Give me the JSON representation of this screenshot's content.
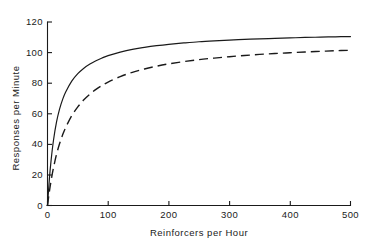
{
  "chart_data": {
    "type": "line",
    "title": "",
    "xlabel": "Reinforcers per Hour",
    "ylabel": "Responses per Minute",
    "xlim": [
      0,
      500
    ],
    "ylim": [
      0,
      120
    ],
    "xticks": [
      0,
      100,
      200,
      300,
      400,
      500
    ],
    "yticks": [
      0,
      20,
      40,
      60,
      80,
      100,
      120
    ],
    "xtick_labels": [
      "0",
      "100",
      "200",
      "300",
      "400",
      "500"
    ],
    "ytick_labels": [
      "0",
      "20",
      "40",
      "60",
      "80",
      "100",
      "120"
    ],
    "grid": false,
    "legend": "none",
    "series": [
      {
        "name": "solid-curve",
        "style": "solid",
        "color": "#1a1a1a",
        "x": [
          0,
          3,
          6,
          10,
          15,
          20,
          25,
          30,
          40,
          50,
          60,
          70,
          80,
          90,
          100,
          120,
          140,
          160,
          180,
          200,
          225,
          250,
          275,
          300,
          325,
          350,
          375,
          400,
          425,
          450,
          475,
          500
        ],
        "y": [
          0,
          16.9,
          29.8,
          43.0,
          54.8,
          63.2,
          69.4,
          74.2,
          81.3,
          86.2,
          89.8,
          92.5,
          94.7,
          96.5,
          98.0,
          100.3,
          102.1,
          103.4,
          104.5,
          105.4,
          106.3,
          107.1,
          107.7,
          108.2,
          108.6,
          109.0,
          109.3,
          109.6,
          109.9,
          110.1,
          110.3,
          110.5
        ]
      },
      {
        "name": "dashed-curve",
        "style": "dashed",
        "color": "#1a1a1a",
        "x": [
          0,
          3,
          6,
          10,
          15,
          20,
          25,
          30,
          40,
          50,
          60,
          70,
          80,
          90,
          100,
          120,
          140,
          160,
          180,
          200,
          225,
          250,
          275,
          300,
          325,
          350,
          375,
          400,
          425,
          450,
          475,
          500
        ],
        "y": [
          0,
          8.9,
          16.4,
          24.9,
          33.6,
          40.5,
          46.2,
          51.0,
          58.7,
          64.5,
          69.1,
          72.8,
          75.9,
          78.5,
          80.7,
          84.3,
          87.1,
          89.3,
          91.1,
          92.6,
          94.1,
          95.4,
          96.4,
          97.3,
          98.1,
          98.8,
          99.4,
          99.9,
          100.4,
          100.8,
          101.2,
          101.5
        ]
      }
    ]
  },
  "axes": {
    "x_title": "Reinforcers per Hour",
    "y_title": "Responses per Minute"
  }
}
